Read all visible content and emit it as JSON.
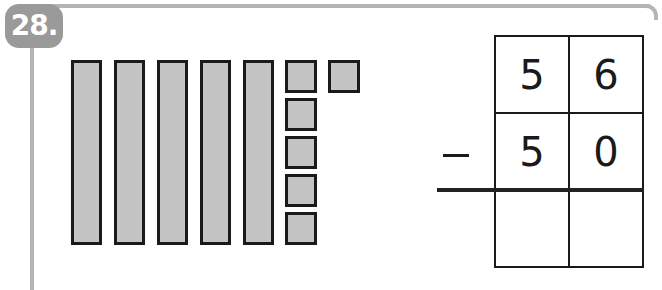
{
  "problem": {
    "number": "28.",
    "colors": {
      "badge": "#9a9a9a",
      "frame": "#b5b5b5",
      "block_fill": "#c4c4c4",
      "block_border": "#1a1a1a"
    }
  },
  "base_ten_blocks": {
    "tens_rods": 5,
    "ones_units": 6,
    "represents": 56
  },
  "subtraction": {
    "operator": "−",
    "minuend": {
      "tens": "5",
      "ones": "6"
    },
    "subtrahend": {
      "tens": "5",
      "ones": "0"
    },
    "answer": {
      "tens": "",
      "ones": ""
    }
  }
}
